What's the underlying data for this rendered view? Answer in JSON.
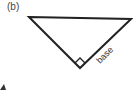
{
  "figure": {
    "part_label": "(b)",
    "side_label": "base",
    "triangle": {
      "vertices": [
        [
          29,
          17
        ],
        [
          131,
          19
        ],
        [
          80,
          68
        ]
      ],
      "right_angle_at": [
        80,
        68
      ],
      "stroke_color": "#222222"
    },
    "partial_shape_fragment": "triangle-corner"
  }
}
